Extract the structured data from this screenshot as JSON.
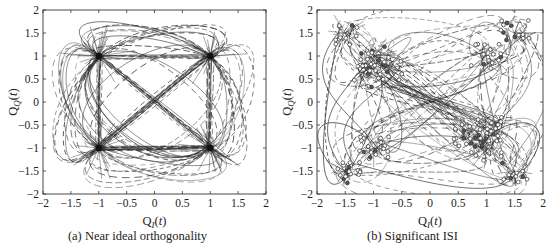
{
  "figure": {
    "panels": [
      {
        "id": "a",
        "caption": "(a) Near ideal orthogonality",
        "xlabel_main": "Q",
        "xlabel_sub": "I",
        "xlabel_tail": "(t)",
        "ylabel_main": "Q",
        "ylabel_sub": "Q",
        "ylabel_tail": "(t)"
      },
      {
        "id": "b",
        "caption": "(b) Significant ISI",
        "xlabel_main": "Q",
        "xlabel_sub": "I",
        "xlabel_tail": "(t)",
        "ylabel_main": "Q",
        "ylabel_sub": "Q",
        "ylabel_tail": "(t)"
      }
    ]
  },
  "chart_data": [
    {
      "type": "scatter",
      "title": "(a) Near ideal orthogonality",
      "xlabel": "Q_I(t)",
      "ylabel": "Q_Q(t)",
      "xlim": [
        -2,
        2
      ],
      "ylim": [
        -2,
        2
      ],
      "xticks": [
        -2,
        -1.5,
        -1,
        -0.5,
        0,
        0.5,
        1,
        1.5,
        2
      ],
      "yticks": [
        -2,
        -1.5,
        -1,
        -0.5,
        0,
        0.5,
        1,
        1.5,
        2
      ],
      "xtick_labels": [
        "−2",
        "−1.5",
        "−1",
        "−0.5",
        "0",
        "0.5",
        "1",
        "1.5",
        "2"
      ],
      "ytick_labels": [
        "−2",
        "−1.5",
        "−1",
        "−0.5",
        "0",
        "0.5",
        "1",
        "1.5",
        "2"
      ],
      "grid": false,
      "description": "QPSK trajectory/constellation with dashed transition paths converging tightly on 4 symbol points",
      "constellation_points": [
        [
          -1,
          1
        ],
        [
          1,
          1
        ],
        [
          -1,
          -1
        ],
        [
          1,
          -1
        ]
      ],
      "trajectory_spread": 0.06,
      "marker_circles": false,
      "seed": 7
    },
    {
      "type": "scatter",
      "title": "(b) Significant ISI",
      "xlabel": "Q_I(t)",
      "ylabel": "Q_Q(t)",
      "xlim": [
        -2,
        2
      ],
      "ylim": [
        -2,
        2
      ],
      "xticks": [
        -2,
        -1.5,
        -1,
        -0.5,
        0,
        0.5,
        1,
        1.5,
        2
      ],
      "yticks": [
        -2,
        -1.5,
        -1,
        -0.5,
        0,
        0.5,
        1,
        1.5,
        2
      ],
      "xtick_labels": [
        "−2",
        "−1.5",
        "−1",
        "−0.5",
        "0",
        "0.5",
        "1",
        "1.5",
        "2"
      ],
      "ytick_labels": [
        "−2",
        "−1.5",
        "−1",
        "−0.5",
        "0",
        "0.5",
        "1",
        "1.5",
        "2"
      ],
      "grid": false,
      "description": "QPSK trajectory with strong ISI: figure-eight shaped paths, samples (small circles) spread near ±1.5 and ±1 clusters",
      "constellation_points": [
        [
          -1.5,
          1.5
        ],
        [
          1.5,
          1.5
        ],
        [
          -1.5,
          -1.5
        ],
        [
          1.5,
          -1.5
        ],
        [
          -1,
          1
        ],
        [
          1,
          1
        ],
        [
          -1,
          -1
        ],
        [
          1,
          -1
        ],
        [
          -0.7,
          0.7
        ],
        [
          0.7,
          -0.7
        ],
        [
          1.1,
          -0.6
        ],
        [
          -1.1,
          0.6
        ]
      ],
      "trajectory_spread": 0.18,
      "marker_circles": true,
      "seed": 13
    }
  ],
  "layout": {
    "axes_a": {
      "left": 43,
      "top": 10,
      "right": 266,
      "bottom": 194
    },
    "axes_b": {
      "left": 42,
      "top": 10,
      "right": 268,
      "bottom": 194
    },
    "ink_color": "#2a2a2a",
    "axis_color": "#333333"
  }
}
